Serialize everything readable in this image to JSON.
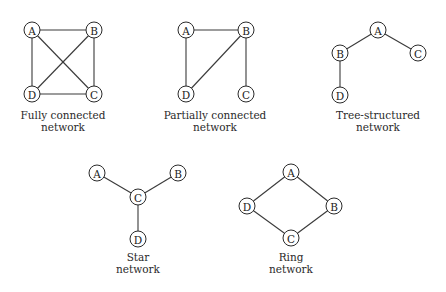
{
  "diagrams": [
    {
      "id": "fully",
      "caption": [
        "Fully connected",
        "network"
      ],
      "caption_pos": [
        63,
        109
      ],
      "nodes": [
        {
          "label": "A",
          "x": 32,
          "y": 30
        },
        {
          "label": "B",
          "x": 94,
          "y": 30
        },
        {
          "label": "C",
          "x": 94,
          "y": 94
        },
        {
          "label": "D",
          "x": 32,
          "y": 94
        }
      ],
      "edges": [
        [
          "A",
          "B"
        ],
        [
          "A",
          "D"
        ],
        [
          "A",
          "C"
        ],
        [
          "B",
          "C"
        ],
        [
          "B",
          "D"
        ],
        [
          "D",
          "C"
        ]
      ]
    },
    {
      "id": "partial",
      "caption": [
        "Partially connected",
        "network"
      ],
      "caption_pos": [
        215,
        109
      ],
      "nodes": [
        {
          "label": "A",
          "x": 186,
          "y": 30
        },
        {
          "label": "B",
          "x": 246,
          "y": 30
        },
        {
          "label": "C",
          "x": 246,
          "y": 94
        },
        {
          "label": "D",
          "x": 186,
          "y": 94
        }
      ],
      "edges": [
        [
          "A",
          "B"
        ],
        [
          "A",
          "D"
        ],
        [
          "B",
          "D"
        ],
        [
          "B",
          "C"
        ]
      ]
    },
    {
      "id": "tree",
      "caption": [
        "Tree-structured",
        "network"
      ],
      "caption_pos": [
        378,
        109
      ],
      "nodes": [
        {
          "label": "A",
          "x": 378,
          "y": 30
        },
        {
          "label": "B",
          "x": 340,
          "y": 53
        },
        {
          "label": "C",
          "x": 418,
          "y": 53
        },
        {
          "label": "D",
          "x": 340,
          "y": 95
        }
      ],
      "edges": [
        [
          "A",
          "B"
        ],
        [
          "A",
          "C"
        ],
        [
          "B",
          "D"
        ]
      ]
    },
    {
      "id": "star",
      "caption": [
        "Star",
        "network"
      ],
      "caption_pos": [
        138,
        251
      ],
      "nodes": [
        {
          "label": "A",
          "x": 97,
          "y": 173
        },
        {
          "label": "B",
          "x": 178,
          "y": 173
        },
        {
          "label": "C",
          "x": 138,
          "y": 197
        },
        {
          "label": "D",
          "x": 138,
          "y": 239
        }
      ],
      "edges": [
        [
          "A",
          "C"
        ],
        [
          "B",
          "C"
        ],
        [
          "C",
          "D"
        ]
      ]
    },
    {
      "id": "ring",
      "caption": [
        "Ring",
        "network"
      ],
      "caption_pos": [
        291,
        251
      ],
      "nodes": [
        {
          "label": "A",
          "x": 291,
          "y": 172
        },
        {
          "label": "B",
          "x": 334,
          "y": 206
        },
        {
          "label": "C",
          "x": 291,
          "y": 238
        },
        {
          "label": "D",
          "x": 247,
          "y": 206
        }
      ],
      "edges": [
        [
          "A",
          "B"
        ],
        [
          "B",
          "C"
        ],
        [
          "C",
          "D"
        ],
        [
          "D",
          "A"
        ]
      ]
    }
  ],
  "node_radius": 8
}
